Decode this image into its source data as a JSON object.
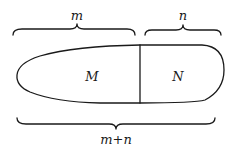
{
  "diagram": {
    "type": "set-partition",
    "labels": {
      "top_left_brace": "m",
      "top_right_brace": "n",
      "bottom_brace": "m+n",
      "region_left": "M",
      "region_right": "N"
    },
    "colors": {
      "ink": "#1a1a1a",
      "background": "#ffffff"
    }
  }
}
